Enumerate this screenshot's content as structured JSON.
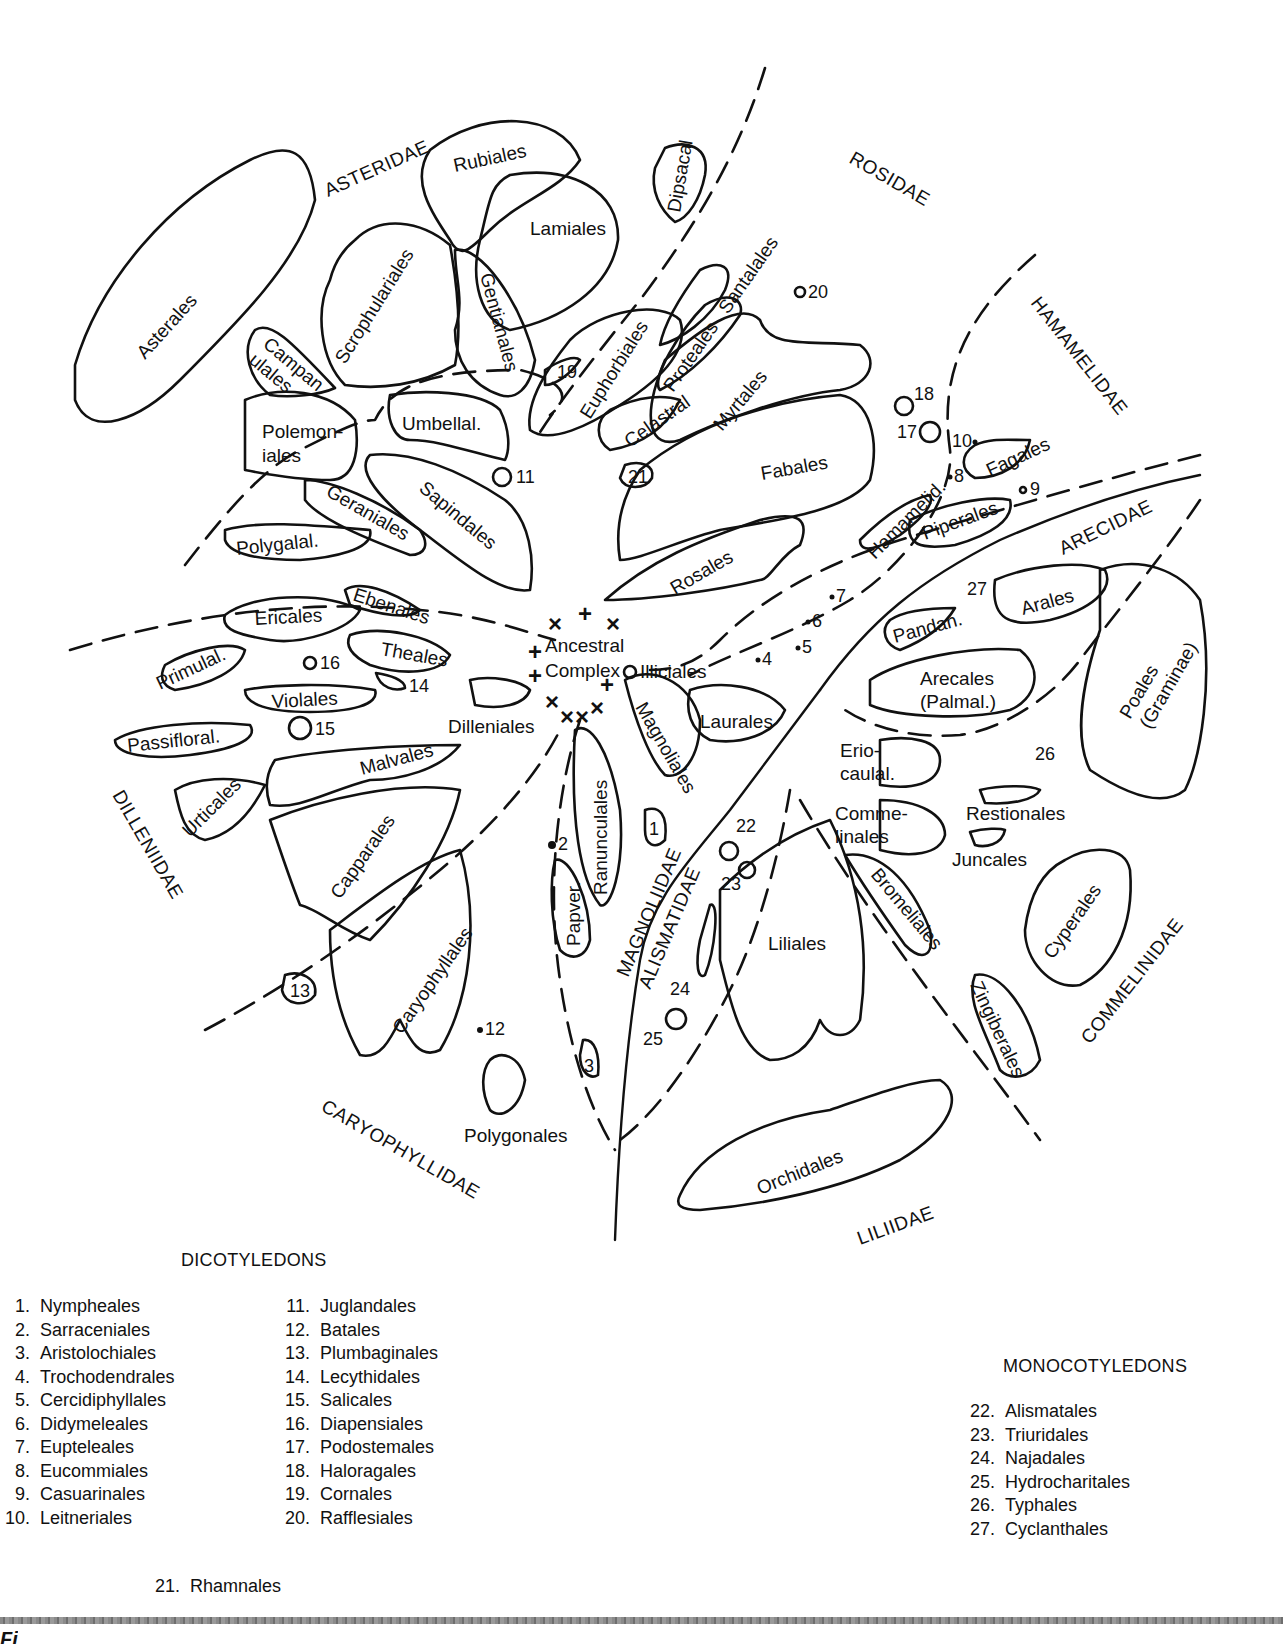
{
  "diagram": {
    "center_label": [
      "Ancestral",
      "Complex"
    ],
    "subclasses": {
      "asteridae": "ASTERIDAE",
      "rosidae": "ROSIDAE",
      "hamamelidae": "HAMAMELIDAE",
      "arecidae": "ARECIDAE",
      "commelinidae": "COMMELINIDAE",
      "liliidae": "LILIIDAE",
      "caryophyllidae": "CARYOPHYLLIDAE",
      "dilleniidae": "DILLENIIDAE",
      "magnoliidae": "MAGNOLIIDAE",
      "alismatidae": "ALISMATIDAE"
    },
    "orders": {
      "asterales": "Asterales",
      "rubiales": "Rubiales",
      "lamiales": "Lamiales",
      "dipsacal": "Dipsacal",
      "scrophulariales": "Scrophulariales",
      "gentianales": "Gentianales",
      "campanulales_1": "Campan",
      "campanulales_2": "ulales",
      "polemoniales_1": "Polemon-",
      "polemoniales_2": "iales",
      "umbellal": "Umbellal.",
      "sapindales": "Sapindales",
      "geraniales": "Geraniales",
      "polygalal": "Polygalal.",
      "euphorbiales": "Euphorbiales",
      "santalales": "Santalales",
      "proteales": "Proteales",
      "celastral": "Celastral",
      "myrtales": "Myrtales",
      "fabales": "Fabales",
      "rosales": "Rosales",
      "hamamelid": "Hamamelid.",
      "fagales": "Fagales",
      "piperales": "Piperales",
      "pandan": "Pandan.",
      "arales": "Arales",
      "arecales_1": "Arecales",
      "arecales_2": "(Palmal.)",
      "poales_1": "Poales",
      "poales_2": "(Graminae)",
      "eriocaulal_1": "Erio-",
      "eriocaulal_2": "caulal.",
      "commelinales_1": "Comme-",
      "commelinales_2": "linales",
      "restionales": "Restionales",
      "juncales": "Juncales",
      "bromeliales": "Bromeliales",
      "cyperales": "Cyperales",
      "zingiberales": "Zingiberales",
      "liliales": "Liliales",
      "orchidales": "Orchidales",
      "ericales": "Ericales",
      "ebenales": "Ebenales",
      "theales": "Theales",
      "primulal": "Primulal.",
      "violales": "Violales",
      "passifloral": "Passifloral.",
      "dilleniales": "Dilleniales",
      "malvales": "Malvales",
      "urticales": "Urticales",
      "capparales": "Capparales",
      "caryophyllales": "Caryophyllales",
      "polygonales": "Polygonales",
      "ranunculales": "Ranunculales",
      "papver": "Papver.",
      "magnoliales": "Magnoliales",
      "laurales": "Laurales",
      "illiciales": "Illiciales"
    },
    "numbers": {
      "n1": "1",
      "n2": "2",
      "n3": "3",
      "n4": "4",
      "n5": "5",
      "n6": "6",
      "n7": "7",
      "n8": "8",
      "n9": "9",
      "n10": "10",
      "n11": "11",
      "n12": "12",
      "n13": "13",
      "n14": "14",
      "n15": "15",
      "n16": "16",
      "n17": "17",
      "n18": "18",
      "n19": "19",
      "n20": "20",
      "n21": "21",
      "n22": "22",
      "n23": "23",
      "n24": "24",
      "n25": "25",
      "n26": "26",
      "n27": "27"
    },
    "markers": {
      "x": "×",
      "plus": "+"
    }
  },
  "legend": {
    "dicots_title": "DICOTYLEDONS",
    "monocots_title": "MONOCOTYLEDONS",
    "dicots_col1": [
      {
        "n": "1.",
        "name": "Nympheales"
      },
      {
        "n": "2.",
        "name": "Sarraceniales"
      },
      {
        "n": "3.",
        "name": "Aristolochiales"
      },
      {
        "n": "4.",
        "name": "Trochodendrales"
      },
      {
        "n": "5.",
        "name": "Cercidiphyllales"
      },
      {
        "n": "6.",
        "name": "Didymeleales"
      },
      {
        "n": "7.",
        "name": "Eupteleales"
      },
      {
        "n": "8.",
        "name": "Eucommiales"
      },
      {
        "n": "9.",
        "name": "Casuarinales"
      },
      {
        "n": "10.",
        "name": "Leitneriales"
      }
    ],
    "dicots_col2": [
      {
        "n": "11.",
        "name": "Juglandales"
      },
      {
        "n": "12.",
        "name": "Batales"
      },
      {
        "n": "13.",
        "name": "Plumbaginales"
      },
      {
        "n": "14.",
        "name": "Lecythidales"
      },
      {
        "n": "15.",
        "name": "Salicales"
      },
      {
        "n": "16.",
        "name": "Diapensiales"
      },
      {
        "n": "17.",
        "name": "Podostemales"
      },
      {
        "n": "18.",
        "name": "Haloragales"
      },
      {
        "n": "19.",
        "name": "Cornales"
      },
      {
        "n": "20.",
        "name": "Rafflesiales"
      }
    ],
    "dicots_extra": {
      "n": "21.",
      "name": "Rhamnales"
    },
    "monocots": [
      {
        "n": "22.",
        "name": "Alismatales"
      },
      {
        "n": "23.",
        "name": "Triuridales"
      },
      {
        "n": "24.",
        "name": "Najadales"
      },
      {
        "n": "25.",
        "name": "Hydrocharitales"
      },
      {
        "n": "26.",
        "name": "Typhales"
      },
      {
        "n": "27.",
        "name": "Cyclanthales"
      }
    ]
  },
  "caption": {
    "label": "Fi"
  }
}
